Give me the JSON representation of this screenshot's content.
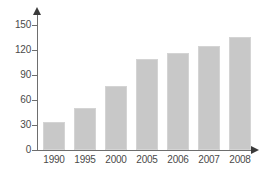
{
  "chart_data": {
    "type": "bar",
    "title": "",
    "subtitle": "",
    "xlabel": "",
    "ylabel": "",
    "categories": [
      "1990",
      "1995",
      "2000",
      "2005",
      "2006",
      "2007",
      "2008"
    ],
    "values": [
      34,
      51,
      77,
      109,
      116,
      125,
      136
    ],
    "series": [
      {
        "name": "",
        "values": [
          34,
          51,
          77,
          109,
          116,
          125,
          136
        ]
      }
    ],
    "ylim": [
      0,
      150
    ],
    "yticks": [
      "0",
      "30",
      "60",
      "90",
      "120",
      "150"
    ],
    "ytick_values": [
      0,
      30,
      60,
      90,
      120,
      150
    ],
    "grid": false,
    "legend": false,
    "legend_position": "none",
    "bar_color": "#c8c8c8",
    "axis_color": "#6e6e6e",
    "text_color": "#4a4a4a",
    "background_color": "#ffffff",
    "annotations": []
  }
}
